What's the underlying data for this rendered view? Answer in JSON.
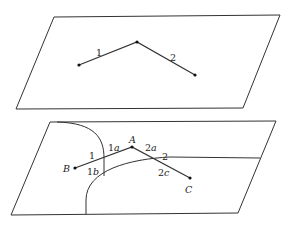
{
  "diagram": {
    "top_plane": {
      "corners": [
        [
          54,
          17
        ],
        [
          280,
          15
        ],
        [
          243,
          108
        ],
        [
          16,
          109
        ]
      ],
      "points": [
        [
          79,
          65
        ],
        [
          137,
          42
        ],
        [
          195,
          75
        ]
      ],
      "labels": [
        {
          "text": "1",
          "x": 96,
          "y": 56
        },
        {
          "text": "2",
          "x": 170,
          "y": 61
        }
      ]
    },
    "bottom_plane": {
      "corners": [
        [
          50,
          122
        ],
        [
          276,
          121
        ],
        [
          238,
          213
        ],
        [
          11,
          215
        ]
      ],
      "points": {
        "B": [
          75,
          168
        ],
        "A": [
          132,
          147
        ],
        "C": [
          190,
          178
        ]
      },
      "point_labels": [
        {
          "text": "B",
          "x": 63,
          "y": 172
        },
        {
          "text": "A",
          "x": 129,
          "y": 143
        },
        {
          "text": "C",
          "x": 185,
          "y": 193
        }
      ],
      "segment_labels": [
        {
          "text": "1",
          "x": 89,
          "y": 159,
          "italic_suffix": ""
        },
        {
          "text": "1",
          "suffix": "a",
          "x": 108,
          "y": 151
        },
        {
          "text": "1",
          "suffix": "b",
          "x": 87,
          "y": 175
        },
        {
          "text": "2",
          "suffix": "a",
          "x": 145,
          "y": 151
        },
        {
          "text": "2",
          "x": 162,
          "y": 160,
          "italic_suffix": ""
        },
        {
          "text": "2",
          "suffix": "c",
          "x": 158,
          "y": 176
        }
      ]
    }
  }
}
